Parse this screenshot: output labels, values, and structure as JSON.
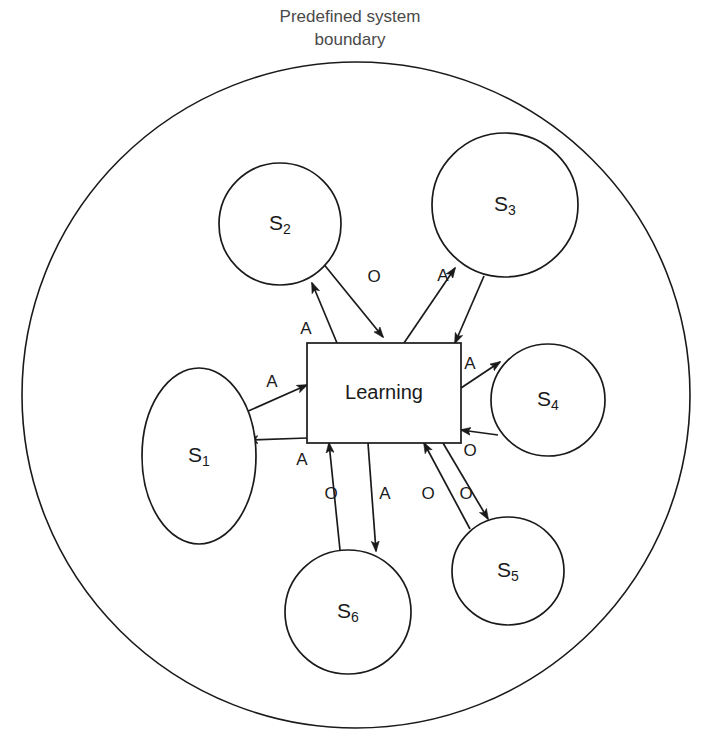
{
  "diagram": {
    "caption": {
      "line1": "Predefined system",
      "line2": "boundary"
    },
    "boundary": {
      "name": "predefined-system-boundary",
      "shape": "ellipse",
      "cx": 356,
      "cy": 395,
      "rx": 334,
      "ry": 333
    },
    "center_node": {
      "label": "Learning",
      "shape": "rectangle",
      "x": 307,
      "y": 343,
      "width": 154,
      "height": 100
    },
    "nodes": [
      {
        "id": "S1",
        "base": "S",
        "sub": "1",
        "shape": "ellipse",
        "cx": 199,
        "cy": 456,
        "rx": 57,
        "ry": 88
      },
      {
        "id": "S2",
        "base": "S",
        "sub": "2",
        "shape": "circle",
        "cx": 280,
        "cy": 224,
        "rx": 61,
        "ry": 61
      },
      {
        "id": "S3",
        "base": "S",
        "sub": "3",
        "shape": "circle",
        "cx": 505,
        "cy": 205,
        "rx": 73,
        "ry": 72
      },
      {
        "id": "S4",
        "base": "S",
        "sub": "4",
        "shape": "circle",
        "cx": 548,
        "cy": 400,
        "rx": 57,
        "ry": 56
      },
      {
        "id": "S5",
        "base": "S",
        "sub": "5",
        "shape": "circle",
        "cx": 508,
        "cy": 571,
        "rx": 56,
        "ry": 54
      },
      {
        "id": "S6",
        "base": "S",
        "sub": "6",
        "shape": "circle",
        "cx": 348,
        "cy": 612,
        "rx": 63,
        "ry": 62
      }
    ],
    "edges": [
      {
        "name": "edge-learning-to-s1",
        "from": "Learning",
        "to": "S1",
        "label": "A",
        "label_x": 302,
        "label_y": 461,
        "x1": 307,
        "y1": 438,
        "x2": 248,
        "y2": 440
      },
      {
        "name": "edge-s1-to-learning",
        "from": "S1",
        "to": "Learning",
        "label": "A",
        "label_x": 272,
        "label_y": 383,
        "x1": 246,
        "y1": 412,
        "x2": 307,
        "y2": 385
      },
      {
        "name": "edge-s2-to-learning",
        "from": "S2",
        "to": "Learning",
        "label": "O",
        "label_x": 374,
        "label_y": 278,
        "x1": 322,
        "y1": 262,
        "x2": 383,
        "y2": 337
      },
      {
        "name": "edge-learning-to-s2",
        "from": "Learning",
        "to": "S2",
        "label": "A",
        "label_x": 306,
        "label_y": 330,
        "x1": 337,
        "y1": 343,
        "x2": 312,
        "y2": 283
      },
      {
        "name": "edge-learning-to-s3",
        "from": "Learning",
        "to": "S3",
        "label": "A",
        "label_x": 443,
        "label_y": 277,
        "x1": 404,
        "y1": 343,
        "x2": 455,
        "y2": 268
      },
      {
        "name": "edge-s3-to-learning",
        "from": "S3",
        "to": "Learning",
        "label": "",
        "label_x": 0,
        "label_y": 0,
        "x1": 484,
        "y1": 276,
        "x2": 455,
        "y2": 343
      },
      {
        "name": "edge-learning-to-s4",
        "from": "Learning",
        "to": "S4",
        "label": "A",
        "label_x": 470,
        "label_y": 365,
        "x1": 461,
        "y1": 388,
        "x2": 500,
        "y2": 362
      },
      {
        "name": "edge-s4-to-learning",
        "from": "S4",
        "to": "Learning",
        "label": "O",
        "label_x": 470,
        "label_y": 452,
        "x1": 498,
        "y1": 435,
        "x2": 461,
        "y2": 430
      },
      {
        "name": "edge-learning-to-s5",
        "from": "Learning",
        "to": "S5",
        "label": "O",
        "label_x": 428,
        "label_y": 495,
        "x1": 443,
        "y1": 443,
        "x2": 488,
        "y2": 519
      },
      {
        "name": "edge-s5-to-learning",
        "from": "S5",
        "to": "Learning",
        "label": "O",
        "label_x": 466,
        "label_y": 495,
        "x1": 470,
        "y1": 529,
        "x2": 424,
        "y2": 443
      },
      {
        "name": "edge-s6-to-learning",
        "from": "S6",
        "to": "Learning",
        "label": "O",
        "label_x": 331,
        "label_y": 495,
        "x1": 340,
        "y1": 550,
        "x2": 329,
        "y2": 443
      },
      {
        "name": "edge-learning-to-s6",
        "from": "Learning",
        "to": "S6",
        "label": "A",
        "label_x": 385,
        "label_y": 495,
        "x1": 368,
        "y1": 443,
        "x2": 376,
        "y2": 551
      }
    ],
    "legend": {
      "A_meaning": "A",
      "O_meaning": "O"
    }
  }
}
